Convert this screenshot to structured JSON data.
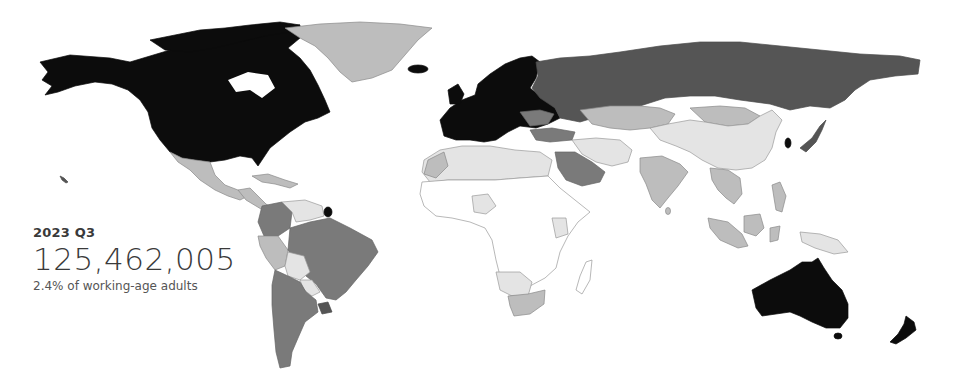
{
  "overlay": {
    "period": "2023 Q3",
    "value": "125,462,005",
    "caption": "2.4% of working-age adults"
  },
  "map": {
    "type": "choropleth",
    "projection": "world",
    "scale_colors": [
      "#ffffff",
      "#e4e4e4",
      "#bdbdbd",
      "#7a7a7a",
      "#555555",
      "#0c0c0c"
    ],
    "regions": [
      {
        "name": "North America (USA/Canada/Alaska)",
        "shade": 5
      },
      {
        "name": "Greenland",
        "shade": 2
      },
      {
        "name": "Iceland",
        "shade": 5
      },
      {
        "name": "Mexico",
        "shade": 2
      },
      {
        "name": "Central America",
        "shade": 2
      },
      {
        "name": "Caribbean",
        "shade": 2
      },
      {
        "name": "Venezuela",
        "shade": 1
      },
      {
        "name": "Colombia",
        "shade": 3
      },
      {
        "name": "Peru",
        "shade": 2
      },
      {
        "name": "Brazil",
        "shade": 3
      },
      {
        "name": "Bolivia",
        "shade": 1
      },
      {
        "name": "Paraguay",
        "shade": 1
      },
      {
        "name": "Argentina",
        "shade": 3
      },
      {
        "name": "Chile",
        "shade": 3
      },
      {
        "name": "Uruguay",
        "shade": 4
      },
      {
        "name": "French Guiana",
        "shade": 5
      },
      {
        "name": "Western Europe",
        "shade": 5
      },
      {
        "name": "Scandinavia",
        "shade": 5
      },
      {
        "name": "Russia",
        "shade": 4
      },
      {
        "name": "Turkey",
        "shade": 3
      },
      {
        "name": "Kazakhstan",
        "shade": 2
      },
      {
        "name": "Mongolia",
        "shade": 2
      },
      {
        "name": "China",
        "shade": 1
      },
      {
        "name": "South Korea",
        "shade": 5
      },
      {
        "name": "Japan",
        "shade": 4
      },
      {
        "name": "India",
        "shade": 2
      },
      {
        "name": "Saudi Arabia",
        "shade": 3
      },
      {
        "name": "Iran",
        "shade": 1
      },
      {
        "name": "North Africa",
        "shade": 1
      },
      {
        "name": "Sub-Saharan Africa",
        "shade": 0
      },
      {
        "name": "South Africa",
        "shade": 2
      },
      {
        "name": "Southeast Asia",
        "shade": 2
      },
      {
        "name": "Indonesia",
        "shade": 2
      },
      {
        "name": "Australia",
        "shade": 5
      },
      {
        "name": "New Zealand",
        "shade": 5
      }
    ]
  }
}
